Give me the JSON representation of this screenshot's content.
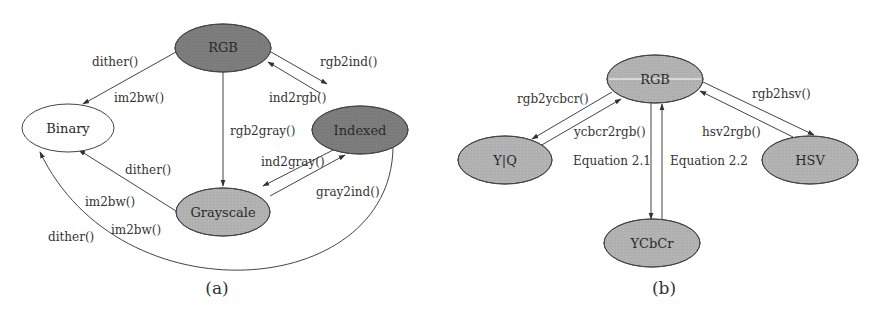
{
  "colors": {
    "dark_node": "#7d7d7d",
    "mid_node": "#b3b3b3",
    "white_node": "#ffffff",
    "edge": "#444444",
    "text": "#333333"
  },
  "diagram_a": {
    "caption": "(a)",
    "nodes": {
      "rgb": "RGB",
      "binary": "Binary",
      "indexed": "Indexed",
      "grayscale": "Grayscale"
    },
    "edges": {
      "rgb_to_binary_1": "dither()",
      "rgb_to_binary_2": "im2bw()",
      "rgb_to_gray": "rgb2gray()",
      "rgb_to_indexed": "rgb2ind()",
      "indexed_to_rgb": "ind2rgb()",
      "indexed_to_gray": "ind2gray()",
      "gray_to_indexed": "gray2ind()",
      "gray_to_binary_1": "dither()",
      "gray_to_binary_2": "im2bw()",
      "indexed_to_binary_1": "im2bw()",
      "indexed_to_binary_2": "dither()"
    }
  },
  "diagram_b": {
    "caption": "(b)",
    "nodes": {
      "rgb": "RGB",
      "yiq": "Y|Q",
      "ycbcr": "YCbCr",
      "hsv": "HSV"
    },
    "edges": {
      "rgb_to_ycbcr_fn": "rgb2ycbcr()",
      "ycbcr_to_rgb_fn": "ycbcr2rgb()",
      "eq_down": "Equation 2.1",
      "eq_up": "Equation 2.2",
      "rgb_to_hsv": "rgb2hsv()",
      "hsv_to_rgb": "hsv2rgb()"
    }
  }
}
